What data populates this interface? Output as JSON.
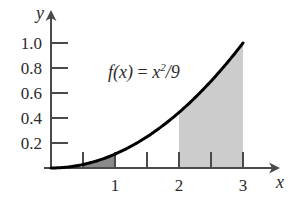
{
  "chart_data": {
    "type": "area",
    "title": "",
    "subtitle": "",
    "xlabel": "x",
    "ylabel": "y",
    "function_label": {
      "prefix": "f",
      "argument": "(x)",
      "equals": " = ",
      "base": "x",
      "exponent": "2",
      "suffix": "/9"
    },
    "function_expression": "f(x) = x^2/9",
    "xlim": [
      0,
      3.45
    ],
    "ylim": [
      0,
      1.12
    ],
    "x_ticks": [
      0.5,
      1,
      1.5,
      2,
      2.5,
      3
    ],
    "x_tick_labels": [
      "",
      "1",
      "",
      "2",
      "",
      "3"
    ],
    "y_ticks": [
      0.2,
      0.4,
      0.6,
      0.8,
      1.0
    ],
    "y_tick_labels": [
      "0.2",
      "0.4",
      "0.6",
      "0.8",
      "1.0"
    ],
    "grid": false,
    "legend": false,
    "curve": {
      "name": "f(x) = x^2/9",
      "x": [
        0,
        0.25,
        0.5,
        0.75,
        1,
        1.25,
        1.5,
        1.75,
        2,
        2.25,
        2.5,
        2.75,
        3
      ],
      "y": [
        0,
        0.007,
        0.028,
        0.063,
        0.111,
        0.174,
        0.25,
        0.34,
        0.444,
        0.563,
        0.694,
        0.84,
        1.0
      ],
      "color": "#000000",
      "line_width": 3
    },
    "shaded_regions": [
      {
        "name": "small-region",
        "x_from": 0.5,
        "x_to": 1,
        "fill": "#8a8a8a",
        "description": "dark shaded area under curve from x=0.5 to x=1"
      },
      {
        "name": "large-region",
        "x_from": 2,
        "x_to": 3,
        "fill": "#cccccc",
        "description": "light shaded area under curve from x=2 to x=3"
      }
    ],
    "axis_color": "#4a4a4a",
    "text_color": "#2b2b2b"
  }
}
